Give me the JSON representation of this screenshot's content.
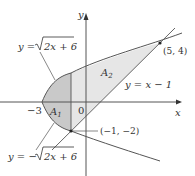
{
  "figure": {
    "axes": {
      "x_label": "x",
      "y_label": "y",
      "origin_label": "0",
      "x_tick_label": "−3"
    },
    "curves": {
      "upper": "y = √(2x + 6)",
      "upper_lhs": "y = ",
      "upper_rad": "2x + 6",
      "lower_lhs": "y = −",
      "lower_rad": "2x + 6",
      "line": "y = x − 1"
    },
    "regions": {
      "a1": "A",
      "a1_sub": "1",
      "a2": "A",
      "a2_sub": "2"
    },
    "points": [
      {
        "label": "(5, 4)",
        "x": 5,
        "y": 4
      },
      {
        "label": "(−1, −2)",
        "x": -1,
        "y": -2
      }
    ],
    "colors": {
      "a1_fill": "#c9c9c9",
      "a2_fill": "#e6e6e6",
      "line": "#555555"
    }
  }
}
